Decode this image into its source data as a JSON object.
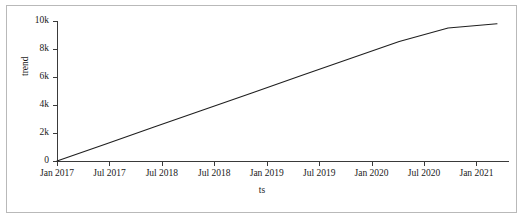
{
  "chart_data": {
    "type": "line",
    "title": "",
    "xlabel": "ts",
    "ylabel": "trend",
    "grid": false,
    "legend": "none",
    "line_color": "#1f1f1f",
    "x_tick_labels": [
      "Jan 2017",
      "Jul 2017",
      "Jul 2018",
      "Jul 2018",
      "Jan 2019",
      "Jul 2019",
      "Jan 2020",
      "Jul 2020",
      "Jan 2021"
    ],
    "y_tick_labels": [
      "0",
      "2k",
      "4k",
      "6k",
      "8k",
      "10k"
    ],
    "y_tick_values": [
      0,
      2000,
      4000,
      6000,
      8000,
      10000
    ],
    "ylim": [
      0,
      10000
    ],
    "series": [
      {
        "name": "trend",
        "x": [
          "Jan 2017",
          "Jul 2017",
          "Jan 2018",
          "Jul 2018",
          "Jan 2019",
          "Jul 2019",
          "Jan 2020",
          "Jul 2020",
          "Jan 2021",
          "Apr 2021"
        ],
        "values": [
          0,
          1220,
          2440,
          3660,
          4880,
          6100,
          7320,
          8540,
          9500,
          9800
        ]
      }
    ]
  }
}
